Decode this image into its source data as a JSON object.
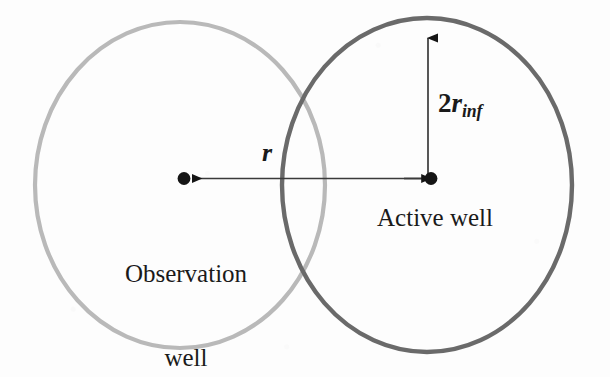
{
  "figure": {
    "type": "well-interference-schematic",
    "background_color": "#fdfdfd",
    "width": 610,
    "height": 377
  },
  "circles": {
    "observation": {
      "name": "observation-well-radius-of-influence",
      "center_x": 180,
      "center_y": 185,
      "radius_x": 145,
      "radius_y": 163,
      "stroke_color": "#b9b9b9",
      "stroke_width": 4
    },
    "active": {
      "name": "active-well-radius-of-influence",
      "center_x": 427,
      "center_y": 185,
      "radius_x": 145,
      "radius_y": 167,
      "stroke_color": "#6a6a6a",
      "stroke_width": 4
    }
  },
  "wells": {
    "observation": {
      "label": "Observation\nwell",
      "label_line1": "Observation",
      "label_line2": "well",
      "marker_x": 186,
      "marker_y": 178,
      "marker_color": "#151515"
    },
    "active": {
      "label": "Active well",
      "marker_x": 428,
      "marker_y": 178,
      "marker_color": "#151515"
    }
  },
  "dimensions": {
    "distance": {
      "label": "r",
      "description": "distance between observation well and active well",
      "arrow_from_x": 428,
      "arrow_to_x": 186,
      "arrow_y": 178,
      "line_color": "#3a3a3a"
    },
    "influence": {
      "label_prefix": "2",
      "label_variable": "r",
      "label_subscript": "inf",
      "label_full": "2rinf",
      "description": "diameter of radius of influence of active well",
      "arrow_from_y": 178,
      "arrow_to_y": 31,
      "arrow_x": 428,
      "line_color": "#3a3a3a"
    }
  },
  "colors": {
    "observation_circle": "#b9b9b9",
    "active_circle": "#6a6a6a",
    "annotation": "#3a3a3a",
    "text": "#1a1a1a",
    "background": "#fdfdfd"
  }
}
